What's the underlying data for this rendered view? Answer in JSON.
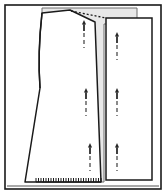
{
  "figure": {
    "title": "Sewing pattern layout diagram",
    "canvas": {
      "width": 166,
      "height": 194
    },
    "colors": {
      "background": "#ffffff",
      "fabric_fill": "#e8e8e8",
      "piece_fill": "#ffffff",
      "outline": "#1a1a1a",
      "light_outline": "#6f6f6f",
      "marker": "#2b2b2b"
    }
  },
  "outer_frame": {
    "name": "diagram border",
    "x": 5,
    "y": 5,
    "width": 156,
    "height": 184,
    "stroke_width": 1.6
  },
  "fabric_panel": {
    "label": "fabric",
    "points": "42,8 137,8 137,24 104,24 104,182 42,182",
    "fill": "#e8e8e8",
    "stroke": "#6f6f6f"
  },
  "pieces": [
    {
      "id": "front-panel",
      "label": "front panel",
      "outline": "M 42,13 C 40,30 38,60 40,88 L 25,182 L 101,182 L 95,22 L 70,10 Z",
      "fill": "#ffffff",
      "stroke": "#1a1a1a",
      "stroke_width": 1.5
    },
    {
      "id": "back-panel",
      "label": "back panel",
      "outline": "M 106,18 L 152,18 L 152,180 L 106,180 Z",
      "fill": "#ffffff",
      "stroke": "#1a1a1a",
      "stroke_width": 1.5
    }
  ],
  "guides": {
    "dotted_top": {
      "label": "dotted guide line",
      "x1": 71,
      "y1": 11,
      "x2": 106,
      "y2": 18,
      "dash": "2 2"
    },
    "hem_hatch": {
      "label": "hatched hem line",
      "x1": 36,
      "y1": 182,
      "x2": 101,
      "y2": 182,
      "tick_count": 27,
      "tick_height": 4
    },
    "baseline": {
      "label": "table baseline",
      "x1": 7,
      "y1": 186,
      "x2": 159,
      "y2": 186
    }
  },
  "markers": [
    {
      "id": "grain-arrow-1",
      "label": "grain arrow",
      "x": 84,
      "y": 20,
      "height": 28
    },
    {
      "id": "grain-arrow-2",
      "label": "grain arrow",
      "x": 86,
      "y": 88,
      "height": 28
    },
    {
      "id": "grain-arrow-3",
      "label": "grain arrow",
      "x": 90,
      "y": 143,
      "height": 28
    },
    {
      "id": "grain-arrow-4",
      "label": "grain arrow",
      "x": 117,
      "y": 32,
      "height": 28
    },
    {
      "id": "grain-arrow-5",
      "label": "grain arrow",
      "x": 117,
      "y": 88,
      "height": 28
    },
    {
      "id": "grain-arrow-6",
      "label": "grain arrow",
      "x": 117,
      "y": 143,
      "height": 28
    }
  ]
}
